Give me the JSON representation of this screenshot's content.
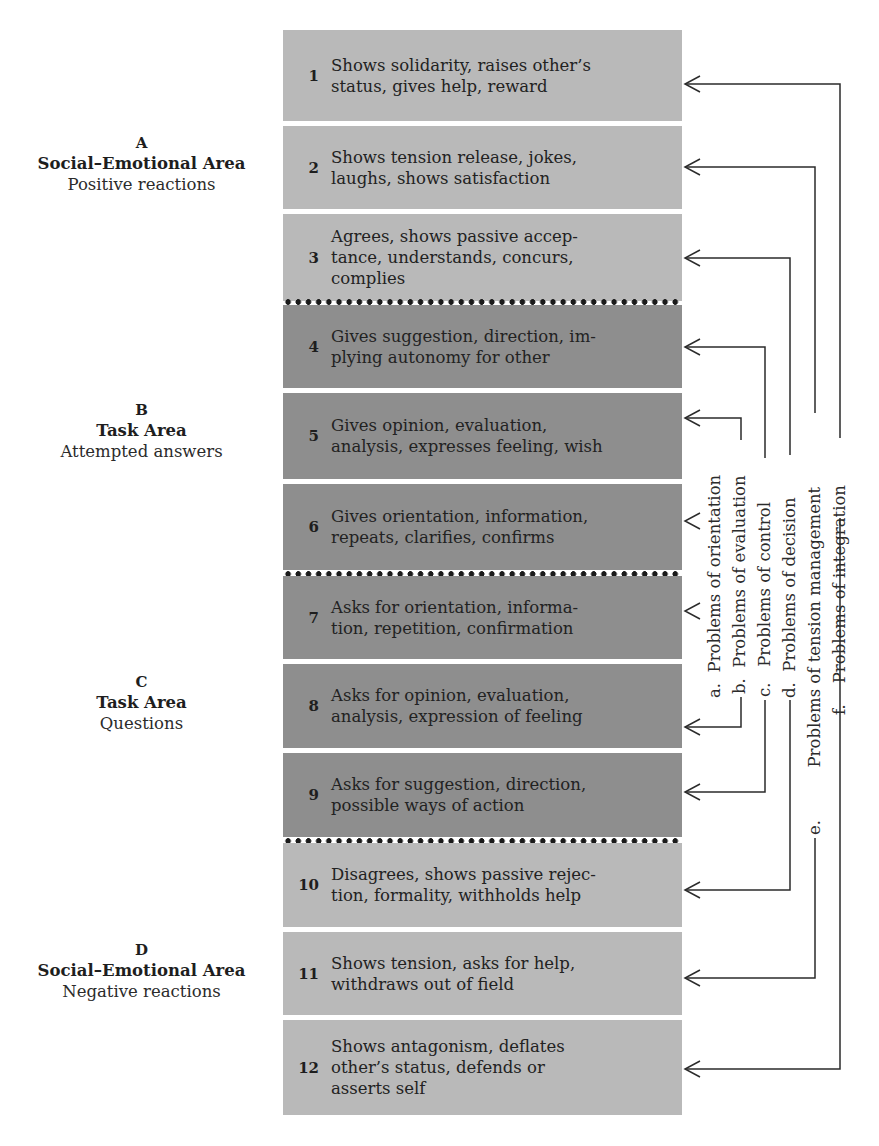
{
  "areas": [
    {
      "letter": "A",
      "title": "Social–Emotional Area",
      "subtitle": "Positive reactions"
    },
    {
      "letter": "B",
      "title": "Task Area",
      "subtitle": "Attempted answers"
    },
    {
      "letter": "C",
      "title": "Task Area",
      "subtitle": "Questions"
    },
    {
      "letter": "D",
      "title": "Social–Emotional Area",
      "subtitle": "Negative reactions"
    }
  ],
  "categories": [
    {
      "num": "1",
      "text": "Shows solidarity, raises other’s status, gives help, reward"
    },
    {
      "num": "2",
      "text": "Shows tension release, jokes, laughs, shows satisfaction"
    },
    {
      "num": "3",
      "text": "Agrees, shows passive acceptance, understands, concurs, complies"
    },
    {
      "num": "4",
      "text": "Gives suggestion, direction, implying autonomy for other"
    },
    {
      "num": "5",
      "text": "Gives opinion, evaluation, analysis, expresses feeling, wish"
    },
    {
      "num": "6",
      "text": "Gives orientation, information, repeats, clarifies, confirms"
    },
    {
      "num": "7",
      "text": "Asks for orientation, information, repetition, confirmation"
    },
    {
      "num": "8",
      "text": "Asks for opinion, evaluation, analysis, expression of feeling"
    },
    {
      "num": "9",
      "text": "Asks for suggestion, direction, possible ways of action"
    },
    {
      "num": "10",
      "text": "Disagrees, shows passive rejection, formality, withholds help"
    },
    {
      "num": "11",
      "text": "Shows tension, asks for help, withdraws out of field"
    },
    {
      "num": "12",
      "text": "Shows antagonism, deflates other’s status, defends or asserts self"
    }
  ],
  "category_lines": [
    [
      "Shows solidarity, raises other’s",
      "status, gives help, reward"
    ],
    [
      "Shows tension release, jokes,",
      "laughs, shows satisfaction"
    ],
    [
      "Agrees, shows passive accep-",
      "tance, understands, concurs,",
      "complies"
    ],
    [
      "Gives suggestion, direction, im-",
      "plying autonomy for other"
    ],
    [
      "Gives opinion, evaluation,",
      "analysis, expresses feeling, wish"
    ],
    [
      "Gives orientation, information,",
      "repeats, clarifies, confirms"
    ],
    [
      "Asks for orientation, informa-",
      "tion, repetition, confirmation"
    ],
    [
      "Asks for opinion, evaluation,",
      "analysis, expression of feeling"
    ],
    [
      "Asks for suggestion, direction,",
      "possible ways of action"
    ],
    [
      "Disagrees, shows passive rejec-",
      "tion, formality, withholds help"
    ],
    [
      "Shows tension, asks for help,",
      "withdraws out of field"
    ],
    [
      "Shows antagonism, deflates",
      "other’s  status, defends or",
      "asserts self"
    ]
  ],
  "problems": [
    {
      "key": "a.",
      "label": "Problems of orientation",
      "pair": [
        "6",
        "7"
      ]
    },
    {
      "key": "b.",
      "label": "Problems of evaluation",
      "pair": [
        "5",
        "8"
      ]
    },
    {
      "key": "c.",
      "label": "Problems of control",
      "pair": [
        "4",
        "9"
      ]
    },
    {
      "key": "d.",
      "label": "Problems of decision",
      "pair": [
        "3",
        "10"
      ]
    },
    {
      "key": "e.",
      "label": "Problems of tension management",
      "pair": [
        "2",
        "11"
      ]
    },
    {
      "key": "f.",
      "label": "Problems of integration",
      "pair": [
        "1",
        "12"
      ]
    }
  ],
  "colors": {
    "light_band": "#b9b9b9",
    "dark_band": "#8e8e8e",
    "line": "#2b2b2b",
    "separator_dots": "#1a1a1a"
  }
}
